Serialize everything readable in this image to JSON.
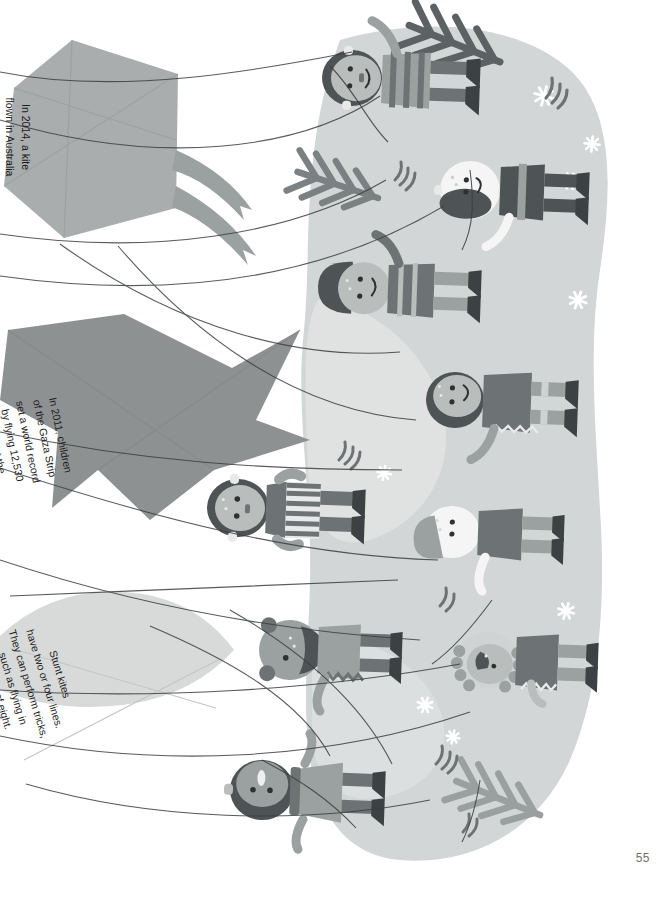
{
  "page": {
    "number": "55",
    "orientation": "rotated-90",
    "background_color": "#ffffff"
  },
  "palette": {
    "paper": "#ffffff",
    "snow_blob": "#d3d6d6",
    "snow_blob_light": "#e3e5e4",
    "kite_grey": "#a9adad",
    "kite_dark": "#8e9192",
    "skin": "#b9bdbc",
    "skin_light": "#f4f5f4",
    "hair_dark": "#4e5455",
    "coat_dark": "#6d7374",
    "coat_mid": "#9ba0a0",
    "boot_dark": "#3c4243",
    "string": "#3a3f40",
    "tree_grey": "#9a9fa0",
    "tree_dark": "#5c6263",
    "snowflake": "#ffffff",
    "page_number": "#6f6f6f",
    "text": "#1a1a1a"
  },
  "facts": [
    {
      "id": "kite-fact-1",
      "text": "In 2014, a kite\nflown in Australia\nsoared to 4800\nmetres – the\nheight of Europe's\ntallest mountain,\nMont Blanc!",
      "shape": "diamond-kite",
      "fill": "#a9adad"
    },
    {
      "id": "kite-fact-2",
      "text": "In 2011, children\nof the Gaza Strip\nset a world record\nby flying 12,530\nkites at the\nsame time.",
      "shape": "delta-kite",
      "fill": "#8e9192"
    },
    {
      "id": "kite-fact-3",
      "text": "Stunt kites\nhave two or four lines.\nThey can perform tricks,\nsuch as flying in\na figure of eight.",
      "shape": "stunt-kite",
      "fill": "#d8dada"
    }
  ],
  "illustration": {
    "title": "children-flying-kites-winter-scene",
    "description": "Illustrated winter scene of children in coats and boots flying kites on a snowy hill, with fir trees, snowflakes and kite strings crossing the page.",
    "children_count": 9,
    "tree_count": 4,
    "snowflake_count": 9
  }
}
